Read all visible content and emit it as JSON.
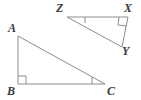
{
  "figure": {
    "type": "geometry-diagram",
    "background_color": "#ffffff",
    "stroke_color": "#8c8c8c",
    "label_color": "#3a3a3a",
    "stroke_width": 1,
    "width": 141,
    "height": 100
  },
  "triangles": [
    {
      "name": "triangle-abc",
      "vertices": [
        {
          "label": "A",
          "x": 18,
          "y": 36,
          "label_x": 8,
          "label_y": 22
        },
        {
          "label": "B",
          "x": 18,
          "y": 84,
          "label_x": 7,
          "label_y": 86
        },
        {
          "label": "C",
          "x": 105,
          "y": 84,
          "label_x": 106,
          "label_y": 86
        }
      ],
      "right_angle_at": "B",
      "tick_angle_at": "C"
    },
    {
      "name": "triangle-zxy",
      "vertices": [
        {
          "label": "Z",
          "x": 67,
          "y": 17,
          "label_x": 55,
          "label_y": 2
        },
        {
          "label": "X",
          "x": 128,
          "y": 17,
          "label_x": 124,
          "label_y": 2
        },
        {
          "label": "Y",
          "x": 122,
          "y": 47,
          "label_x": 122,
          "label_y": 44
        }
      ],
      "right_angle_at": "X",
      "tick_angle_at": "Z"
    }
  ],
  "labels": {
    "a": "A",
    "b": "B",
    "c": "C",
    "x": "X",
    "y": "Y",
    "z": "Z"
  },
  "marks": {
    "right_angle_square_b": "right-angle-marker",
    "right_angle_square_x": "right-angle-marker",
    "angle_tick_c": "angle-tick-marker",
    "angle_tick_z": "angle-tick-marker"
  }
}
